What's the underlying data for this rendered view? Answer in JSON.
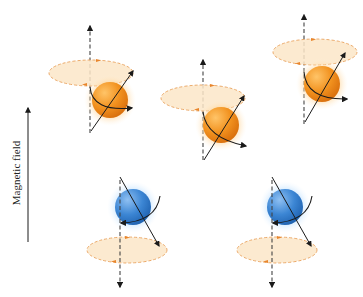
{
  "diagram": {
    "field_label": "Magnetic field",
    "colors": {
      "orange_sphere": "#f0901e",
      "orange_highlight": "#ffd08a",
      "blue_sphere": "#3b86d6",
      "blue_highlight": "#a9d4ff",
      "ellipse_fill": "#fbe6c8",
      "ellipse_stroke": "#e9a25c",
      "direction_marker": "#e8852c",
      "axis": "#333333",
      "vector": "#1a1a1a"
    },
    "panels": [
      {
        "id": "spin-up-1",
        "spin": "up",
        "sphere_color": "orange"
      },
      {
        "id": "spin-up-2",
        "spin": "up",
        "sphere_color": "orange"
      },
      {
        "id": "spin-up-3",
        "spin": "up",
        "sphere_color": "orange"
      },
      {
        "id": "spin-down-1",
        "spin": "down",
        "sphere_color": "blue"
      },
      {
        "id": "spin-down-2",
        "spin": "down",
        "sphere_color": "blue"
      }
    ]
  }
}
